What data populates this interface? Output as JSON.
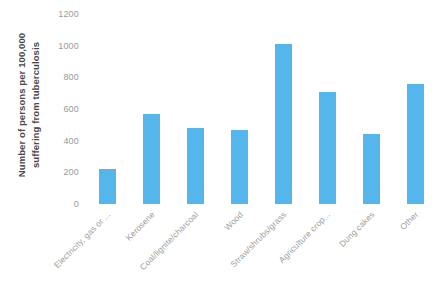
{
  "chart_data": {
    "type": "bar",
    "title": "",
    "xlabel": "",
    "ylabel": "Number of  persons per 100,000 suffering from tuberculosis",
    "ylabel_line1": "Number of  persons per 100,000",
    "ylabel_line2": "suffering from tuberculosis",
    "ylim": [
      0,
      1200
    ],
    "ytick_step": 200,
    "yticks": [
      "1200",
      "1000",
      "800",
      "600",
      "400",
      "200",
      "0"
    ],
    "ytick_values": [
      1200,
      1000,
      800,
      600,
      400,
      200,
      0
    ],
    "grid": false,
    "legend": false,
    "bar_color": "#54b6ea",
    "categories": [
      "Electricity, gas or ...",
      "Kerosene",
      "Coal/lignite/charcoal",
      "Wood",
      "Straw/shrubs/grass",
      "Agriculture crop...",
      "Dung cakes",
      "Other"
    ],
    "values": [
      220,
      570,
      480,
      470,
      1010,
      705,
      445,
      760
    ]
  }
}
